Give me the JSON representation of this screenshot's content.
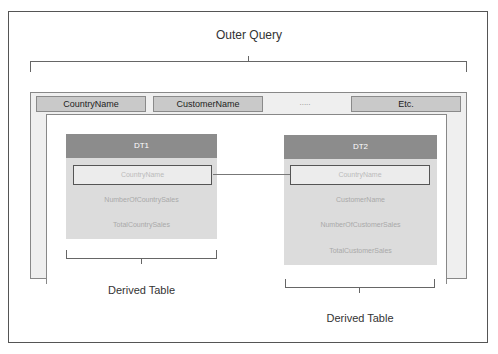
{
  "diagram": {
    "title": "Outer Query",
    "outer_query_columns": [
      "CountryName",
      "CustomerName",
      ".....",
      "Etc."
    ],
    "derived_tables": [
      {
        "name": "DT1",
        "join_column": "CountryName",
        "columns": [
          "CountryName",
          "NumberOfCountrySales",
          "TotalCountrySales"
        ],
        "label": "Derived Table"
      },
      {
        "name": "DT2",
        "join_column": "CountryName",
        "columns": [
          "CountryName",
          "CustomerName",
          "NumberOfCustomerSales",
          "TotalCustomerSales"
        ],
        "label": "Derived Table"
      }
    ],
    "colors": {
      "header": "#8c8c8c",
      "body": "#dcdcdc",
      "column_box": "#c9c9c9",
      "outer_band": "#efefef"
    }
  }
}
